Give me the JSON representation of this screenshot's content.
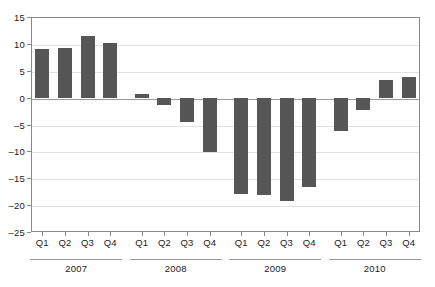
{
  "chart_data": {
    "type": "bar",
    "title": "",
    "subtitle": "",
    "xlabel": "",
    "ylabel": "",
    "ylim": [
      -25,
      15
    ],
    "ytick_step": 5,
    "yticks": [
      15,
      10,
      5,
      0,
      -5,
      -10,
      -15,
      -20,
      -25
    ],
    "ytick_labels": [
      "15",
      "10",
      "5",
      "0",
      "-5",
      "-10",
      "-15",
      "-20",
      "-25"
    ],
    "grid": true,
    "legend": "none",
    "bar_color": "#565656",
    "axis_color": "#8a8a8a",
    "grid_color": "#e2e2e2",
    "categories": [
      "Q1",
      "Q2",
      "Q3",
      "Q4",
      "Q1",
      "Q2",
      "Q3",
      "Q4",
      "Q1",
      "Q2",
      "Q3",
      "Q4",
      "Q1",
      "Q2",
      "Q3",
      "Q4"
    ],
    "values": [
      9.0,
      9.3,
      11.4,
      10.1,
      0.7,
      -1.4,
      -4.6,
      -10.2,
      -18.0,
      -18.2,
      -19.2,
      -16.6,
      -6.2,
      -2.3,
      3.2,
      3.9
    ],
    "groups": [
      {
        "label": "2007",
        "start_index": 0,
        "end_index": 3
      },
      {
        "label": "2008",
        "start_index": 4,
        "end_index": 7
      },
      {
        "label": "2009",
        "start_index": 8,
        "end_index": 11
      },
      {
        "label": "2010",
        "start_index": 12,
        "end_index": 15
      }
    ]
  }
}
